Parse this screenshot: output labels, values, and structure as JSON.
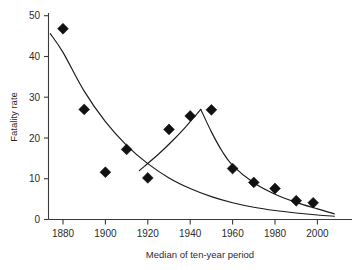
{
  "chart_data": {
    "type": "scatter",
    "title": "",
    "xlabel": "Median of ten-year period",
    "ylabel": "Fatality rate",
    "xlim": [
      1872,
      2010
    ],
    "ylim": [
      0,
      51
    ],
    "grid": false,
    "legend": null,
    "xticks": [
      1880,
      1900,
      1920,
      1940,
      1960,
      1980,
      2000
    ],
    "yticks": [
      0,
      10,
      20,
      30,
      40,
      50
    ],
    "series": [
      {
        "name": "Fatality rate",
        "marker": "filled-diamond",
        "x": [
          1880,
          1890,
          1900,
          1910,
          1920,
          1930,
          1940,
          1950,
          1960,
          1970,
          1980,
          1990,
          1998
        ],
        "values": [
          46.8,
          27.0,
          11.6,
          17.2,
          10.2,
          22.1,
          25.4,
          26.9,
          12.5,
          9.1,
          7.6,
          4.6,
          4.1
        ]
      }
    ],
    "fitted_curves": [
      {
        "name": "declining-baseline-curve",
        "description": "Smooth monotonically decreasing exponential-like fit spanning the full x range",
        "x": [
          1874,
          1880,
          1890,
          1900,
          1910,
          1920,
          1930,
          1940,
          1950,
          1960,
          1970,
          1980,
          1990,
          2000,
          2008
        ],
        "values": [
          45.6,
          41.0,
          31.5,
          24.0,
          18.2,
          13.7,
          10.2,
          7.6,
          5.6,
          4.1,
          3.0,
          2.2,
          1.6,
          1.1,
          0.8
        ]
      },
      {
        "name": "war-peak-rise-curve",
        "description": "Rising segment from about 1916 up to the 1945 peak",
        "x": [
          1916,
          1925,
          1932,
          1938,
          1942,
          1945
        ],
        "values": [
          12.0,
          16.0,
          19.5,
          22.8,
          25.2,
          27.0
        ]
      },
      {
        "name": "war-peak-decay-curve",
        "description": "Steep post-peak decay merging into the baseline near 2005",
        "x": [
          1945,
          1950,
          1955,
          1960,
          1970,
          1980,
          1990,
          2000,
          2008
        ],
        "values": [
          27.0,
          21.5,
          16.8,
          13.3,
          9.0,
          6.2,
          4.2,
          2.6,
          1.4
        ]
      }
    ]
  },
  "axes": {
    "y_tick_labels": [
      "0",
      "10",
      "20",
      "30",
      "40",
      "50"
    ],
    "x_tick_labels": [
      "1880",
      "1900",
      "1920",
      "1940",
      "1960",
      "1980",
      "2000"
    ],
    "x_axis_title": "Median of ten-year period",
    "y_axis_title": "Fatality rate"
  },
  "colors": {
    "marker": "#111111",
    "curve": "#1a1a1a",
    "axis": "#3a3a3a",
    "text": "#2b2b2b",
    "background": "#ffffff"
  }
}
